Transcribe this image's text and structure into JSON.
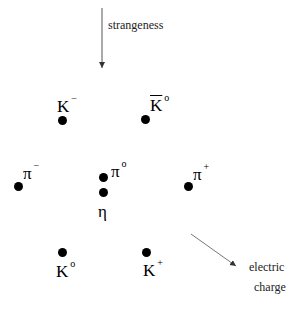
{
  "diagram": {
    "type": "meson octet (eightfold way)",
    "axes": {
      "strangeness": {
        "label": "strangeness",
        "direction": "down"
      },
      "charge": {
        "label_line1": "electric",
        "label_line2": "charge",
        "direction": "down-right"
      }
    },
    "particles": [
      {
        "id": "k-minus",
        "base": "K",
        "sup": "−",
        "bar": false,
        "dot": [
          62,
          120
        ],
        "label": [
          57,
          98
        ]
      },
      {
        "id": "k0-bar",
        "base": "K",
        "sup": "o",
        "bar": true,
        "dot": [
          145,
          119
        ],
        "label": [
          150,
          97
        ]
      },
      {
        "id": "pi-minus",
        "base": "π",
        "sup": "−",
        "bar": false,
        "dot": [
          18,
          186
        ],
        "label": [
          23,
          165
        ]
      },
      {
        "id": "pi-zero",
        "base": "π",
        "sup": "o",
        "bar": false,
        "dot": [
          103,
          177
        ],
        "label": [
          111,
          163
        ]
      },
      {
        "id": "eta",
        "base": "η",
        "sup": "",
        "bar": false,
        "dot": [
          103,
          192
        ],
        "label": [
          98,
          203
        ]
      },
      {
        "id": "pi-plus",
        "base": "π",
        "sup": "+",
        "bar": false,
        "dot": [
          188,
          186
        ],
        "label": [
          193,
          166
        ]
      },
      {
        "id": "k-zero",
        "base": "K",
        "sup": "o",
        "bar": false,
        "dot": [
          62,
          252
        ],
        "label": [
          56,
          263
        ]
      },
      {
        "id": "k-plus",
        "base": "K",
        "sup": "+",
        "bar": false,
        "dot": [
          146,
          252
        ],
        "label": [
          143,
          262
        ]
      }
    ]
  }
}
